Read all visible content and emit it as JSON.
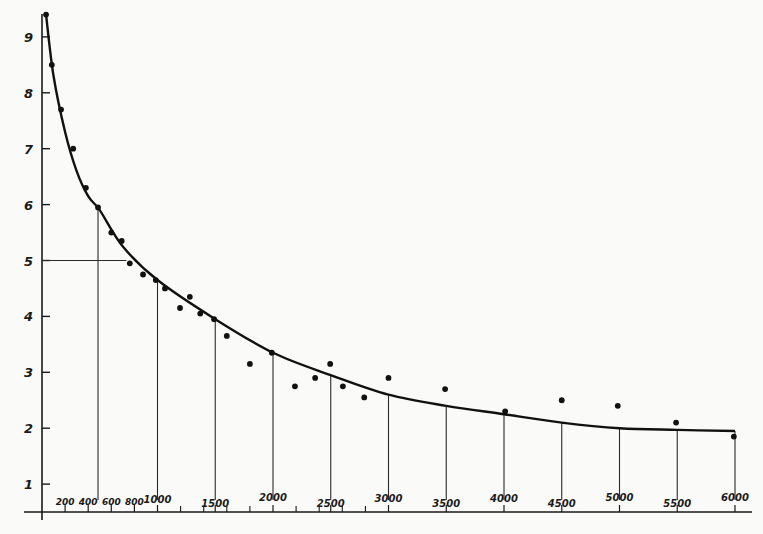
{
  "chart_data": {
    "type": "scatter",
    "title": "",
    "xlabel": "",
    "ylabel": "",
    "xlim": [
      0,
      6000
    ],
    "ylim": [
      0,
      9.5
    ],
    "grid": false,
    "y_ticks": [
      1,
      2,
      3,
      4,
      5,
      6,
      7,
      8,
      9
    ],
    "x_tick_labels": [
      "200",
      "400",
      "600",
      "800",
      "1000",
      "1500",
      "2000",
      "2500",
      "3000",
      "3500",
      "4000",
      "4500",
      "5000",
      "5500",
      "6000"
    ],
    "x_minor_ticks": [
      1200,
      1400,
      1600,
      1800,
      2200,
      2400,
      2600,
      2800
    ],
    "series": [
      {
        "name": "observed points",
        "type": "scatter",
        "x": [
          35,
          85,
          165,
          270,
          380,
          485,
          600,
          690,
          760,
          875,
          985,
          1065,
          1195,
          1280,
          1370,
          1490,
          1600,
          1800,
          1990,
          2190,
          2365,
          2495,
          2605,
          2790,
          3000,
          3490,
          4010,
          4500,
          4985,
          5490,
          5990
        ],
        "y": [
          9.4,
          8.5,
          7.7,
          7.0,
          6.3,
          5.95,
          5.5,
          5.35,
          4.95,
          4.75,
          4.65,
          4.5,
          4.15,
          4.35,
          4.05,
          3.95,
          3.65,
          3.15,
          3.35,
          2.75,
          2.9,
          3.15,
          2.75,
          2.55,
          2.9,
          2.7,
          2.3,
          2.5,
          2.4,
          2.1,
          1.85
        ]
      },
      {
        "name": "fitted curve",
        "type": "line",
        "x": [
          35,
          100,
          200,
          300,
          400,
          500,
          700,
          1000,
          1500,
          2000,
          2500,
          3000,
          3500,
          4000,
          4500,
          5000,
          5500,
          6000
        ],
        "y": [
          9.4,
          8.3,
          7.3,
          6.6,
          6.15,
          5.9,
          5.25,
          4.65,
          3.95,
          3.35,
          2.95,
          2.6,
          2.4,
          2.25,
          2.1,
          2.0,
          1.97,
          1.95
        ]
      }
    ],
    "annotations": [
      {
        "type": "vertical-drop-lines",
        "x": [
          485,
          1000,
          1500,
          2000,
          2500,
          3000,
          3500,
          4000,
          4500,
          5000,
          5500,
          6000
        ]
      },
      {
        "type": "horizontal-reference-line",
        "y": 5,
        "x_end": 800
      }
    ]
  }
}
